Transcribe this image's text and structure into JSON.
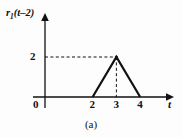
{
  "figure": {
    "caption": "(a)",
    "background_color": "#fdfdfd",
    "line_color": "#111111"
  },
  "chart_data": {
    "type": "line",
    "title": "",
    "subtitle": "",
    "xlabel": "t",
    "ylabel": "r₁(t−2)",
    "ylabel_parts": {
      "base": "r",
      "subscript": "1",
      "argument": "(t–2)"
    },
    "series": [
      {
        "name": "r1(t-2)",
        "x": [
          2,
          3,
          4
        ],
        "values": [
          0,
          2,
          0
        ],
        "style": "solid",
        "color": "#111111",
        "width": 2.2
      }
    ],
    "x": [
      2,
      3,
      4
    ],
    "categories": [
      "2",
      "3",
      "4"
    ],
    "values": [
      0,
      2,
      0
    ],
    "xlim": [
      0,
      4.6
    ],
    "ylim": [
      0,
      2.6
    ],
    "xticks": [
      0,
      2,
      3,
      4
    ],
    "xtick_labels": [
      "0",
      "2",
      "3",
      "4"
    ],
    "yticks": [
      2
    ],
    "ytick_labels": [
      "2"
    ],
    "grid": false,
    "legend": false,
    "legend_position": "none",
    "annotations": [
      {
        "kind": "dashed-guide",
        "orientation": "horizontal",
        "from": [
          0,
          2
        ],
        "to": [
          3,
          2
        ],
        "label": "2"
      },
      {
        "kind": "dashed-guide",
        "orientation": "vertical",
        "from": [
          3,
          0
        ],
        "to": [
          3,
          2
        ],
        "label": "3"
      },
      {
        "kind": "peak-marker",
        "at": [
          3,
          2
        ]
      }
    ],
    "axis_arrows": {
      "x": "right",
      "y": "up"
    }
  },
  "labels": {
    "origin": "0",
    "x_tick_2": "2",
    "x_tick_3": "3",
    "x_tick_4": "4",
    "y_tick_2": "2",
    "x_axis_name": "t"
  }
}
